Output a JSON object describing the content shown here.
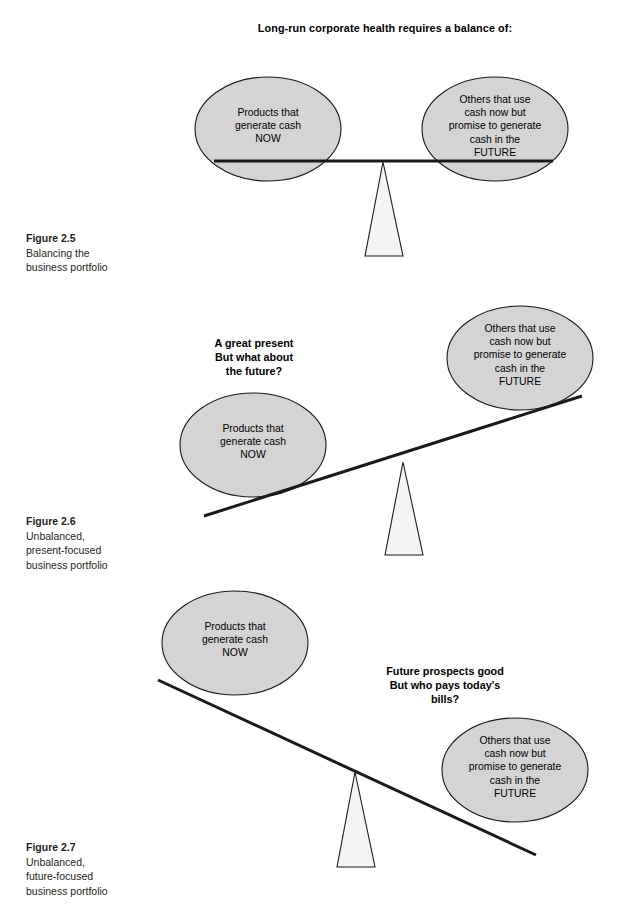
{
  "document": {
    "page_background": "#ffffff",
    "ellipse_fill": "#d4d4d4",
    "ellipse_stroke": "#1a1a1a",
    "beam_color": "#1a1a1a",
    "fulcrum_fill": "#f4f4f4",
    "fulcrum_stroke": "#1a1a1a"
  },
  "labels": {
    "products_now": {
      "line1": "Products that",
      "line2": "generate cash",
      "line3": "NOW"
    },
    "others_future": {
      "line1": "Others that use",
      "line2": "cash now but",
      "line3": "promise to generate",
      "line4": "cash in the",
      "line5": "FUTURE"
    }
  },
  "figures": [
    {
      "id": "2.5",
      "heading": "Long-run corporate health requires a balance of:",
      "caption": {
        "title": "Figure 2.5",
        "line1": "Balancing the",
        "line2": "business portfolio"
      },
      "state": "balanced",
      "beam_tilt_degrees": 0,
      "callout": null
    },
    {
      "id": "2.6",
      "heading": "",
      "caption": {
        "title": "Figure 2.6",
        "line1": "Unbalanced,",
        "line2": "present-focused",
        "line3": "business portfolio"
      },
      "state": "present-focused",
      "beam_tilt_degrees": -18,
      "callout": {
        "line1": "A great present",
        "line2": "But what about",
        "line3": "the future?"
      }
    },
    {
      "id": "2.7",
      "heading": "",
      "caption": {
        "title": "Figure 2.7",
        "line1": "Unbalanced,",
        "line2": "future-focused",
        "line3": "business portfolio"
      },
      "state": "future-focused",
      "beam_tilt_degrees": 24,
      "callout": {
        "line1": "Future prospects good",
        "line2": "But who pays today's",
        "line3": "bills?"
      }
    }
  ]
}
